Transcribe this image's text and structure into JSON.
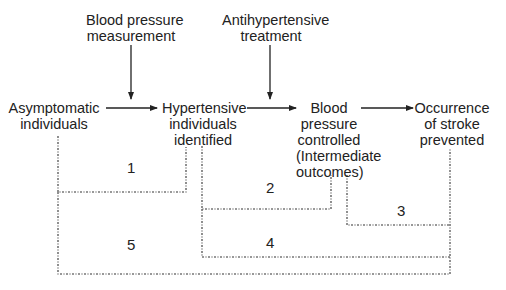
{
  "diagram": {
    "nodes": {
      "asymptomatic": [
        "Asymptomatic",
        "individuals"
      ],
      "hypertensive": [
        "Hypertensive",
        "individuals",
        "identified"
      ],
      "bp_controlled": [
        "Blood",
        "pressure",
        "controlled",
        "(Intermediate",
        "outcomes)"
      ],
      "stroke_prevented": [
        "Occurrence",
        "of stroke",
        "prevented"
      ]
    },
    "interventions": {
      "bp_measurement": [
        "Blood pressure",
        "measurement"
      ],
      "antihypertensive": [
        "Antihypertensive",
        "treatment"
      ]
    },
    "paths": [
      "1",
      "2",
      "3",
      "4",
      "5"
    ],
    "colors": {
      "line": "#222222",
      "text": "#222222",
      "background": "#ffffff"
    }
  }
}
